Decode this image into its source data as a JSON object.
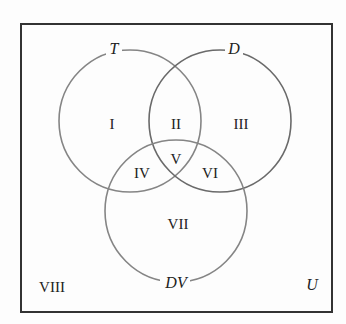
{
  "diagram": {
    "type": "venn",
    "universe": {
      "label": "U"
    },
    "sets": [
      {
        "id": "T",
        "label": "T"
      },
      {
        "id": "D",
        "label": "D"
      },
      {
        "id": "DV",
        "label": "DV"
      }
    ],
    "regions": [
      {
        "id": "I",
        "label": "I",
        "in": [
          "T"
        ]
      },
      {
        "id": "II",
        "label": "II",
        "in": [
          "T",
          "D"
        ]
      },
      {
        "id": "III",
        "label": "III",
        "in": [
          "D"
        ]
      },
      {
        "id": "IV",
        "label": "IV",
        "in": [
          "T",
          "DV"
        ]
      },
      {
        "id": "V",
        "label": "V",
        "in": [
          "T",
          "D",
          "DV"
        ]
      },
      {
        "id": "VI",
        "label": "VI",
        "in": [
          "D",
          "DV"
        ]
      },
      {
        "id": "VII",
        "label": "VII",
        "in": [
          "DV"
        ]
      },
      {
        "id": "VIII",
        "label": "VIII",
        "in": []
      }
    ],
    "colors": {
      "frame": "#333333",
      "circle": "#808080",
      "circle_dark": "#666666",
      "text": "#222222"
    }
  }
}
